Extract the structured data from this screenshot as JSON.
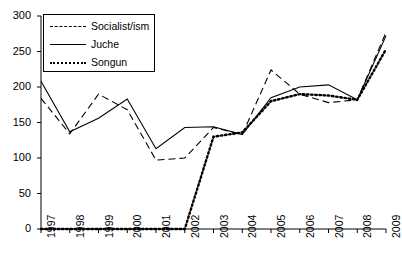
{
  "chart_data": {
    "type": "line",
    "title": "",
    "subtitle": "",
    "xlabel": "",
    "ylabel": "",
    "categories": [
      "1997",
      "1998",
      "1999",
      "2000",
      "2001",
      "2002",
      "2003",
      "2004",
      "2005",
      "2006",
      "2007",
      "2008",
      "2009"
    ],
    "ylim": [
      0,
      300
    ],
    "yticks": [
      0,
      50,
      100,
      150,
      200,
      250,
      300
    ],
    "ytick_labels": [
      "0",
      "50",
      "100",
      "150",
      "200",
      "250",
      "300"
    ],
    "grid": false,
    "legend_position": "top-left",
    "series": [
      {
        "name": "Socialist/ism",
        "style": "dashed",
        "color": "#000000",
        "values": [
          184,
          134,
          190,
          168,
          97,
          100,
          143,
          133,
          224,
          190,
          178,
          182,
          277
        ]
      },
      {
        "name": "Juche",
        "style": "solid",
        "color": "#000000",
        "values": [
          208,
          137,
          156,
          183,
          113,
          143,
          144,
          133,
          185,
          200,
          203,
          182,
          272
        ]
      },
      {
        "name": "Songun",
        "style": "dotted",
        "color": "#000000",
        "values": [
          0,
          0,
          0,
          0,
          0,
          0,
          130,
          136,
          180,
          190,
          188,
          182,
          253
        ]
      }
    ]
  },
  "legend": {
    "items": [
      {
        "label": "Socialist/ism"
      },
      {
        "label": "Juche"
      },
      {
        "label": "Songun"
      }
    ]
  }
}
